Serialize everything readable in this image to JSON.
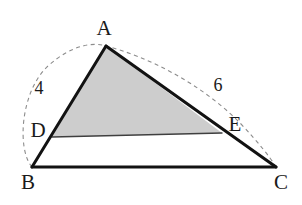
{
  "figure": {
    "background_color": "#ffffff",
    "stroke_color": "#121212",
    "shaded_fill_color": "#cdcdcd",
    "dashed_stroke_color": "#8c8c8c",
    "thin_line_color": "#3f3f3f",
    "points": {
      "A": {
        "label": "A",
        "x": 106,
        "y": 46,
        "label_x": 104,
        "label_y": 28
      },
      "B": {
        "label": "B",
        "x": 32,
        "y": 167,
        "label_x": 28,
        "label_y": 182
      },
      "C": {
        "label": "C",
        "x": 276,
        "y": 167,
        "label_x": 281,
        "label_y": 182
      },
      "D": {
        "label": "D",
        "x": 52,
        "y": 137,
        "label_x": 38,
        "label_y": 130
      },
      "E": {
        "label": "E",
        "x": 222,
        "y": 133,
        "label_x": 235,
        "label_y": 124
      }
    },
    "measures": [
      {
        "name": "segment-bd-length",
        "value": "4",
        "x": 39,
        "y": 88
      },
      {
        "name": "segment-ce-length",
        "value": "6",
        "x": 218,
        "y": 85
      }
    ],
    "segments": [
      {
        "name": "segment-ab",
        "from": "B",
        "to": "A",
        "style": "solid-thick"
      },
      {
        "name": "segment-ac",
        "from": "A",
        "to": "C",
        "style": "solid-thick"
      },
      {
        "name": "segment-bc",
        "from": "B",
        "to": "C",
        "style": "solid-thick"
      },
      {
        "name": "segment-de",
        "from": "D",
        "to": "E",
        "style": "solid-thin"
      }
    ],
    "shaded_region": {
      "name": "triangle-ade",
      "vertices": [
        "A",
        "D",
        "E"
      ]
    },
    "arc": {
      "name": "dashed-arc-bac",
      "from": "B",
      "through": "A",
      "to": "C",
      "style": "dashed",
      "dash_pattern": "4 3.5"
    }
  }
}
